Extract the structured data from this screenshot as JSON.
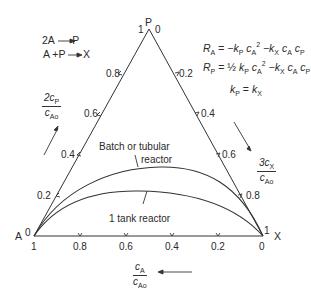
{
  "diagram": {
    "type": "triangular composition diagram",
    "vertices": {
      "top": {
        "label": "P",
        "left_value": "1",
        "right_value": "0"
      },
      "left": {
        "label": "A",
        "value": "0"
      },
      "right": {
        "label": "X",
        "value": "1"
      }
    },
    "reactions": [
      "2A → P",
      "A + P → X"
    ],
    "rate_equations": {
      "RA": {
        "lhs": "R",
        "lhs_sub": "A",
        "rhs": "= −kₚ cₐ² −kₓ cₐ cₚ"
      },
      "RP": {
        "lhs": "R",
        "lhs_sub": "P",
        "rhs": "= ½ kₚ cₐ² −kₓ cₐ cₚ"
      },
      "constants": "kₚ = kₓ"
    },
    "left_axis": {
      "label_num": "2c",
      "label_num_sub": "P",
      "label_den": "c",
      "label_den_sub": "Ao",
      "ticks": [
        "0.8",
        "0.6",
        "0.4",
        "0.2"
      ]
    },
    "right_axis": {
      "label_num": "3c",
      "label_num_sub": "X",
      "label_den": "c",
      "label_den_sub": "Ao",
      "ticks": [
        "0.2",
        "0.4",
        "0.6",
        "0.8"
      ]
    },
    "bottom_axis": {
      "label_num": "c",
      "label_num_sub": "A",
      "label_den": "c",
      "label_den_sub": "Ao",
      "ticks": [
        "1",
        "0.8",
        "0.6",
        "0.4",
        "0.2",
        "0"
      ]
    },
    "curves": [
      {
        "name": "Batch or tubular reactor",
        "label_line1": "Batch or tubular",
        "label_line2": "reactor"
      },
      {
        "name": "1 tank reactor",
        "label_line1": "1 tank reactor"
      }
    ],
    "colors": {
      "line": "#333333",
      "text": "#2a2a2a",
      "background": "#ffffff"
    }
  }
}
